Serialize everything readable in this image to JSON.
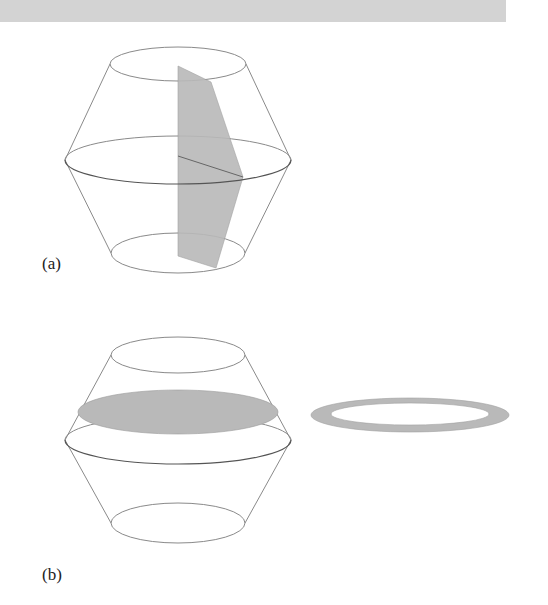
{
  "header_bar": {
    "color": "#d3d3d3"
  },
  "figures": [
    {
      "label": "(a)",
      "description": "Solid of revolution (double frustum) cut by a vertical plane through its axis",
      "shading_color": "#b9b9b9"
    },
    {
      "label": "(b)",
      "description": "Same solid cut by a horizontal plane, producing an annular (washer) cross-section",
      "cross_section": "ring",
      "shading_color": "#b9b9b9"
    }
  ],
  "colors": {
    "outline": "#8a8a8a",
    "outline_dark": "#555555",
    "fill": "#b9b9b9"
  }
}
